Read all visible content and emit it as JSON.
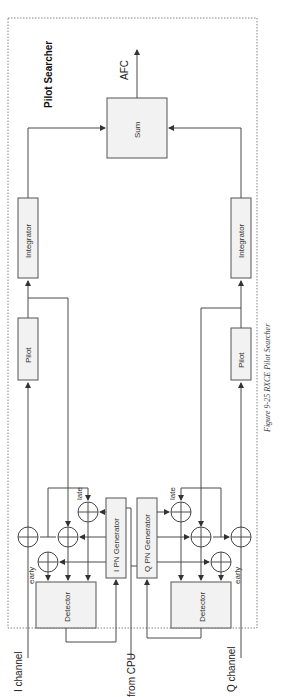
{
  "diagram": {
    "title": "Pilot Searcher",
    "caption": "Figure 9-25 RXCE Pilot Searcher",
    "blocks": {
      "sum": "Sum",
      "integrator_i": "Integrator",
      "integrator_q": "Integrator",
      "pilot_i": "Pilot",
      "pilot_q": "Pilot",
      "i_pn_generator": "I PN Generator",
      "q_pn_generator": "Q PN Generator",
      "detector_i": "Detector",
      "detector_q": "Detector"
    },
    "labels": {
      "output": "AFC",
      "i_input": "I channel",
      "q_input": "Q channel",
      "cpu_input": "from CPU",
      "late_i": "late",
      "late_q": "late",
      "early_i": "early",
      "early_q": "early"
    },
    "orientation": "rotated 90° counter-clockwise"
  }
}
